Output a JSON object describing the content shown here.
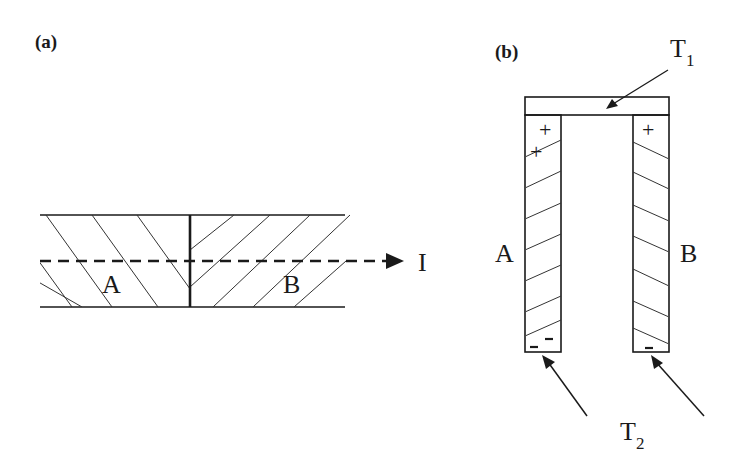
{
  "panels": {
    "a": {
      "label": "(a)",
      "material_left": "A",
      "material_right": "B",
      "current_label": "I"
    },
    "b": {
      "label": "(b)",
      "material_left": "A",
      "material_right": "B",
      "hot_junction": {
        "main": "T",
        "sub": "1"
      },
      "cold_junction": {
        "main": "T",
        "sub": "2"
      },
      "charge_positive": "+",
      "charge_negative": "–"
    }
  },
  "colors": {
    "line": "#1a1a1a",
    "hatch": "#333333",
    "background": "#ffffff"
  }
}
